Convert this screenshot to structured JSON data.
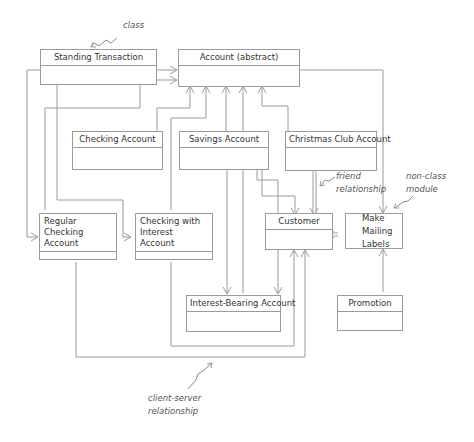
{
  "diagram": {
    "classes": {
      "standing_transaction": "Standing Transaction",
      "account": "Account (abstract)",
      "checking_account": "Checking Account",
      "savings_account": "Savings Account",
      "christmas_club_account": "Christmas Club Account",
      "regular_checking_account": "Regular Checking\nAccount",
      "checking_with_interest": "Checking with\nInterest Account",
      "customer": "Customer",
      "interest_bearing_account": "Interest-Bearing Account",
      "promotion": "Promotion"
    },
    "modules": {
      "make_mailing_labels": "Make\nMailing\nLabels"
    },
    "annotations": {
      "class": "class",
      "friend_relationship": "friend\nrelationship",
      "non_class_module": "non-class\nmodule",
      "client_server_relationship": "client-server\nrelationship"
    }
  }
}
